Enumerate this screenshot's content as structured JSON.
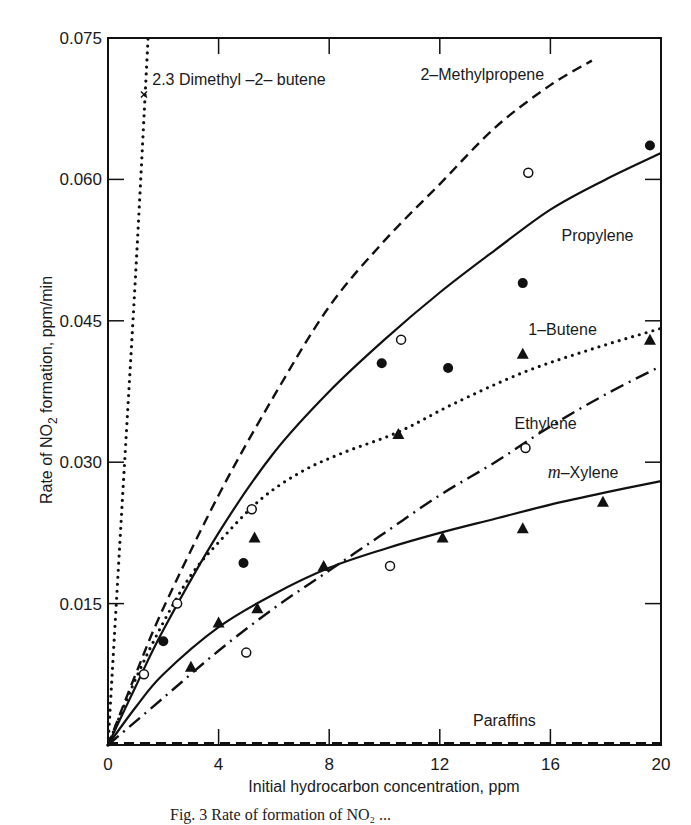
{
  "chart_data": {
    "type": "line",
    "title": "",
    "xlabel": "Initial hydrocarbon concentration, ppm",
    "ylabel": "Rate of NO2 formation, ppm/min",
    "xlim": [
      0,
      20
    ],
    "ylim": [
      0,
      0.075
    ],
    "x_ticks": [
      0,
      4,
      8,
      12,
      16,
      20
    ],
    "x_tick_labels": [
      "0",
      "4",
      "8",
      "12",
      "16",
      "20"
    ],
    "y_ticks": [
      0.015,
      0.03,
      0.045,
      0.06,
      0.075
    ],
    "y_tick_labels": [
      "0.015",
      "0.030",
      "0.045",
      "0.060",
      "0.075"
    ],
    "grid": false,
    "legend": "inline labels",
    "series": [
      {
        "name": "2.3 Dimethyl-2-butene",
        "line_style": "dotted",
        "marker": "x",
        "curve": [
          [
            0,
            0
          ],
          [
            0.5,
            0.025
          ],
          [
            1.0,
            0.05
          ],
          [
            1.45,
            0.075
          ]
        ],
        "points": [
          [
            1.3,
            0.069
          ]
        ],
        "label_pos": [
          1.6,
          0.07
        ]
      },
      {
        "name": "2-Methylpropene",
        "line_style": "dashed",
        "marker": "open-circle",
        "curve": [
          [
            0,
            0
          ],
          [
            1,
            0.0075
          ],
          [
            2,
            0.0145
          ],
          [
            4,
            0.0265
          ],
          [
            6,
            0.037
          ],
          [
            8,
            0.0465
          ],
          [
            10,
            0.0535
          ],
          [
            12,
            0.0595
          ],
          [
            14,
            0.0655
          ],
          [
            16,
            0.07
          ],
          [
            17.5,
            0.0726
          ]
        ],
        "points": [
          [
            1.3,
            0.0075
          ],
          [
            2.5,
            0.015
          ],
          [
            5.2,
            0.025
          ],
          [
            10.6,
            0.043
          ],
          [
            15.2,
            0.0607
          ]
        ],
        "label_pos": [
          11.3,
          0.0705
        ]
      },
      {
        "name": "Propylene",
        "line_style": "solid",
        "marker": "filled-circle",
        "curve": [
          [
            0,
            0
          ],
          [
            1,
            0.0062
          ],
          [
            2,
            0.0122
          ],
          [
            4,
            0.0225
          ],
          [
            6,
            0.031
          ],
          [
            8,
            0.0375
          ],
          [
            10,
            0.043
          ],
          [
            12,
            0.048
          ],
          [
            14,
            0.0525
          ],
          [
            16,
            0.0568
          ],
          [
            18,
            0.06
          ],
          [
            20,
            0.0628
          ]
        ],
        "points": [
          [
            2.0,
            0.011
          ],
          [
            4.9,
            0.0193
          ],
          [
            9.9,
            0.0405
          ],
          [
            12.3,
            0.04
          ],
          [
            15.0,
            0.049
          ],
          [
            19.6,
            0.0636
          ]
        ],
        "label_pos": [
          16.4,
          0.0535
        ]
      },
      {
        "name": "1-Butene",
        "line_style": "dotted",
        "marker": "filled-triangle",
        "curve": [
          [
            0,
            0
          ],
          [
            1,
            0.007
          ],
          [
            2,
            0.013
          ],
          [
            3,
            0.018
          ],
          [
            4,
            0.0215
          ],
          [
            5.5,
            0.026
          ],
          [
            7,
            0.029
          ],
          [
            8.5,
            0.031
          ],
          [
            10.5,
            0.0332
          ],
          [
            12.5,
            0.0362
          ],
          [
            15,
            0.0395
          ],
          [
            17.5,
            0.042
          ],
          [
            20,
            0.0442
          ]
        ],
        "points": [
          [
            5.3,
            0.022
          ],
          [
            10.5,
            0.033
          ],
          [
            15.0,
            0.0415
          ],
          [
            19.6,
            0.043
          ]
        ],
        "label_pos": [
          15.2,
          0.0435
        ]
      },
      {
        "name": "Ethylene",
        "line_style": "dash-dot",
        "marker": "open-circle",
        "curve": [
          [
            0,
            0
          ],
          [
            2,
            0.005
          ],
          [
            4,
            0.01
          ],
          [
            6,
            0.0145
          ],
          [
            8,
            0.0185
          ],
          [
            10,
            0.0225
          ],
          [
            12,
            0.0265
          ],
          [
            14,
            0.03
          ],
          [
            16,
            0.0338
          ],
          [
            18,
            0.0372
          ],
          [
            20,
            0.0402
          ]
        ],
        "points": [
          [
            5.0,
            0.0098
          ],
          [
            10.2,
            0.019
          ],
          [
            15.1,
            0.0315
          ]
        ],
        "label_pos": [
          14.7,
          0.0335
        ]
      },
      {
        "name": "m-Xylene",
        "line_style": "solid",
        "marker": "filled-triangle",
        "curve": [
          [
            0,
            0
          ],
          [
            1,
            0.004
          ],
          [
            2,
            0.0075
          ],
          [
            4,
            0.0125
          ],
          [
            6,
            0.016
          ],
          [
            8,
            0.0188
          ],
          [
            10,
            0.0208
          ],
          [
            12,
            0.0225
          ],
          [
            14,
            0.024
          ],
          [
            16,
            0.0255
          ],
          [
            18,
            0.0268
          ],
          [
            20,
            0.028
          ]
        ],
        "points": [
          [
            3.0,
            0.0083
          ],
          [
            4.0,
            0.013
          ],
          [
            5.4,
            0.0145
          ],
          [
            7.8,
            0.019
          ],
          [
            12.1,
            0.022
          ],
          [
            15.0,
            0.023
          ],
          [
            17.9,
            0.0258
          ]
        ],
        "label_pos": [
          15.9,
          0.0283
        ]
      },
      {
        "name": "Paraffins",
        "line_style": "dashed",
        "marker": "none",
        "curve": [
          [
            0,
            0.0002
          ],
          [
            20,
            0.0002
          ]
        ],
        "points": [],
        "label_pos": [
          13.2,
          0.002
        ]
      }
    ]
  },
  "caption": "Fig. 3   Rate of formation of NO₂ ..."
}
